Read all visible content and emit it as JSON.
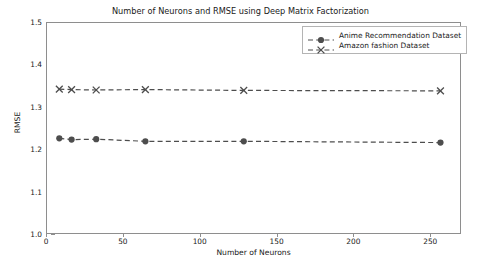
{
  "chart_data": {
    "type": "line",
    "title": "Number of Neurons and RMSE using Deep Matrix Factorization",
    "xlabel": "Number of Neurons",
    "ylabel": "RMSE",
    "x": [
      8,
      16,
      32,
      64,
      128,
      256
    ],
    "xlim": [
      0,
      270
    ],
    "ylim": [
      1.0,
      1.5
    ],
    "xticks": [
      0,
      50,
      100,
      150,
      200,
      250
    ],
    "xtick_labels": [
      "0",
      "50",
      "100",
      "150",
      "200",
      "250"
    ],
    "yticks": [
      1.0,
      1.1,
      1.2,
      1.3,
      1.4,
      1.5
    ],
    "ytick_labels": [
      "1.0",
      "1.1",
      "1.2",
      "1.3",
      "1.4",
      "1.5"
    ],
    "grid": false,
    "legend_position": "upper right",
    "series": [
      {
        "name": "Anime Recommendation Dataset",
        "marker": "circle",
        "linestyle": "dashed",
        "color": "#4d4d4d",
        "values": [
          1.228,
          1.225,
          1.226,
          1.221,
          1.221,
          1.218
        ]
      },
      {
        "name": "Amazon fashion Dataset",
        "marker": "x",
        "linestyle": "dashed",
        "color": "#4d4d4d",
        "values": [
          1.344,
          1.343,
          1.342,
          1.343,
          1.341,
          1.34
        ]
      }
    ]
  },
  "legend": {
    "entries": [
      {
        "label": "Anime Recommendation Dataset"
      },
      {
        "label": "Amazon fashion Dataset"
      }
    ]
  },
  "colors": {
    "series": "#4d4d4d",
    "axis": "#8e8e8e",
    "text": "#1a1a1a",
    "background": "#ffffff"
  }
}
